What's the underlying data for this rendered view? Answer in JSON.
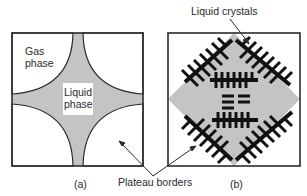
{
  "panel_a": {
    "label": "(a)",
    "gas_label_line1": "Gas",
    "gas_label_line2": "phase",
    "liquid_label_line1": "Liquid",
    "liquid_label_line2": "phase"
  },
  "panel_b": {
    "label": "(b)",
    "callout": "Liquid crystals"
  },
  "shared": {
    "callout": "Plateau borders"
  },
  "colors": {
    "liquid_fill": "#c4c4c4",
    "outline": "#2b2b2b",
    "crystal": "#111111"
  }
}
